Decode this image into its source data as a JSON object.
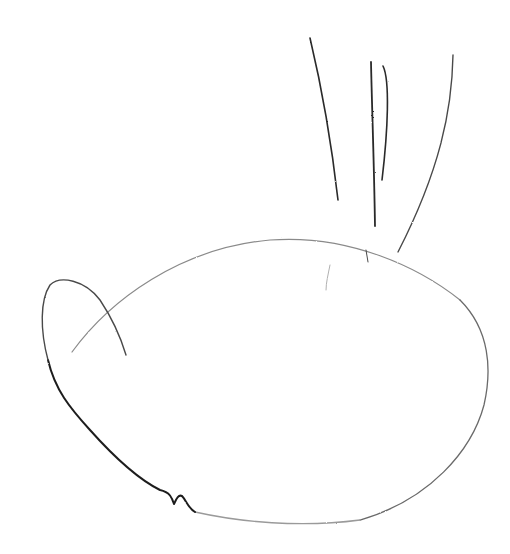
{
  "image": {
    "kind": "pencil sketch",
    "description": "Hand-drawn pencil sketch of an oval body with a small loop on the left and four upward strokes above",
    "background_color": "#ffffff",
    "stroke_color": "#2a2a2a",
    "light_stroke_color": "#9a9a9a"
  }
}
